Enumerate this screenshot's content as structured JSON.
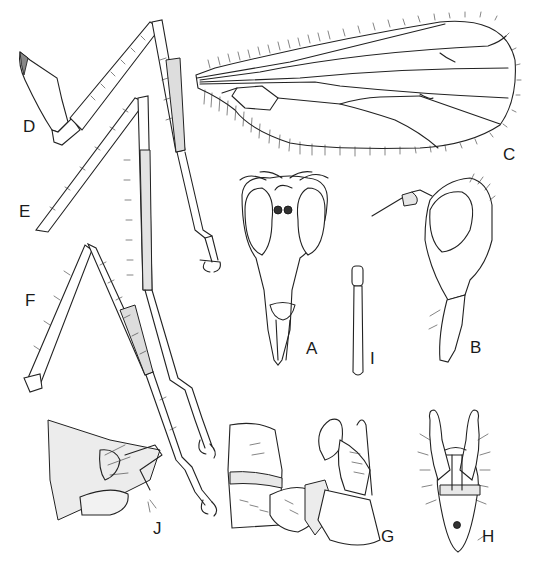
{
  "figure": {
    "type": "scientific-illustration-plate",
    "background": "#ffffff",
    "ink_color": "#222222",
    "panels": [
      {
        "id": "A",
        "label": "A",
        "content": "head, frontal view"
      },
      {
        "id": "B",
        "label": "B",
        "content": "head, lateral view with antenna"
      },
      {
        "id": "C",
        "label": "C",
        "content": "wing"
      },
      {
        "id": "D",
        "label": "D",
        "content": "fore leg"
      },
      {
        "id": "E",
        "label": "E",
        "content": "mid leg"
      },
      {
        "id": "F",
        "label": "F",
        "content": "hind leg"
      },
      {
        "id": "G",
        "label": "G",
        "content": "male terminalia, lateral view"
      },
      {
        "id": "H",
        "label": "H",
        "content": "male terminalia, dorsal view"
      },
      {
        "id": "I",
        "label": "I",
        "content": "palpus / appendage"
      },
      {
        "id": "J",
        "label": "J",
        "content": "female terminalia, lateral view"
      }
    ]
  },
  "labels": {
    "A": "A",
    "B": "B",
    "C": "C",
    "D": "D",
    "E": "E",
    "F": "F",
    "G": "G",
    "H": "H",
    "I": "I",
    "J": "J"
  }
}
